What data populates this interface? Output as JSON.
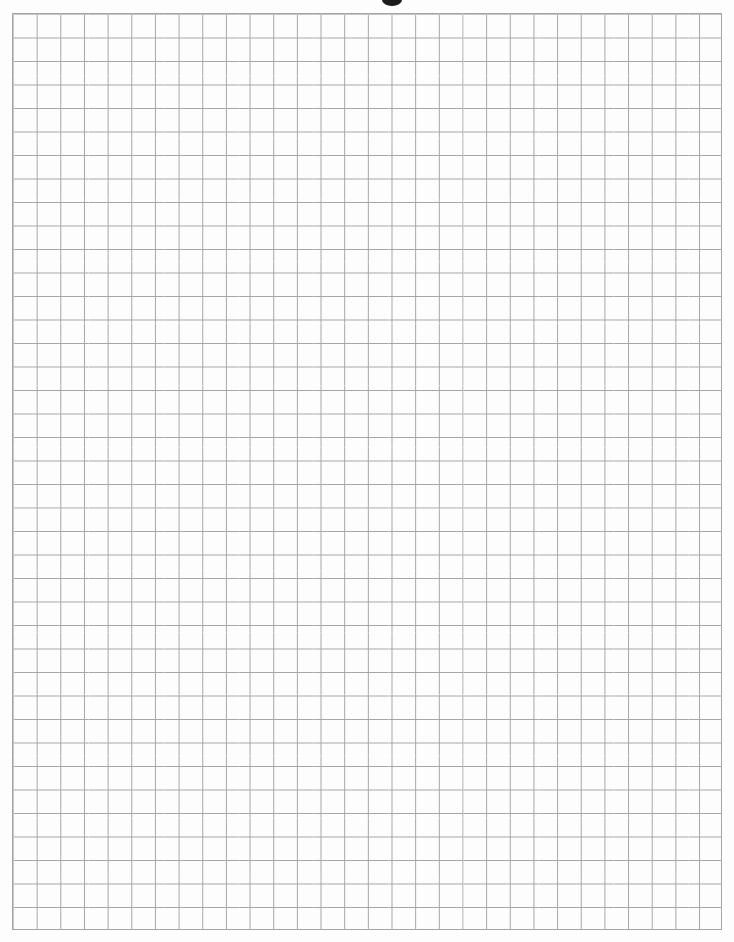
{
  "page": {
    "kind": "scanned blank quad-ruled graph paper",
    "paper_color": "#fdfdfd",
    "width_px": 734,
    "height_px": 942
  },
  "grid": {
    "line_color": "#a5a5a5",
    "columns": 30,
    "rows": 39,
    "left_px": 12,
    "top_px": 13,
    "width_px": 710,
    "height_px": 917
  },
  "artifacts": {
    "top_mark": {
      "description": "cut-off bottom of a bold printed letter from the page header above the scan crop",
      "color": "#1c1c1c",
      "center_x_px": 392,
      "width_px": 20,
      "height_px": 12
    }
  }
}
